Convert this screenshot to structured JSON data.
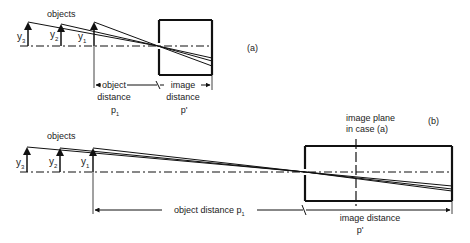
{
  "diagram": {
    "colors": {
      "line": "#111111",
      "text": "#222222",
      "background": "#ffffff"
    },
    "panel_a": {
      "label": "(a)",
      "objects_label": "objects",
      "object_labels": {
        "y3": "y",
        "y3_sub": "3",
        "y2": "y",
        "y2_sub": "2",
        "y1": "y",
        "y1_sub": "1"
      },
      "object_distance_line1": "object",
      "object_distance_line2": "distance",
      "object_distance_symbol": "p",
      "object_distance_sub": "1",
      "image_distance_line1": "image",
      "image_distance_line2": "distance",
      "image_distance_symbol": "p'"
    },
    "panel_b": {
      "label": "(b)",
      "objects_label": "objects",
      "object_labels": {
        "y3": "y",
        "y3_sub": "3",
        "y2": "y",
        "y2_sub": "2",
        "y1": "y",
        "y1_sub": "1"
      },
      "image_plane_line1": "image plane",
      "image_plane_line2": "in case (a)",
      "object_distance_text": "object distance p",
      "object_distance_sub": "1",
      "image_distance_text": "image distance",
      "image_distance_symbol": "p'"
    }
  }
}
